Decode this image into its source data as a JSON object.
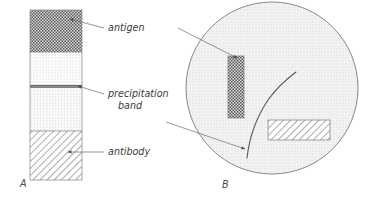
{
  "figure": {
    "type": "immunodiffusion-precipitation-diagram",
    "background_color": "#ffffff",
    "line_color": "#6b6b6b",
    "text_color": "#3b3b3b"
  },
  "panels": [
    {
      "id": "A",
      "label": "A",
      "label_x": 20,
      "label_y": 187,
      "description": "tube showing layered antigen, precipitation band and antibody"
    },
    {
      "id": "B",
      "label": "B",
      "label_x": 222,
      "label_y": 188,
      "description": "magnified circular inset of the precipitation zone"
    }
  ],
  "tube": {
    "x": 30,
    "y": 10,
    "width": 52,
    "height": 170,
    "border_color": "#808080",
    "segments": [
      {
        "name": "antigen",
        "pattern": "dark-checker",
        "y": 10,
        "height": 42,
        "fill": "#6e6e6e"
      },
      {
        "name": "upper-clear-zone",
        "pattern": "fine-stipple-light",
        "y": 52,
        "height": 33,
        "fill": "#f6f6f6"
      },
      {
        "name": "precipitation-band",
        "pattern": "solid-dark-line",
        "y": 85,
        "height": 3,
        "fill": "#8a8a8a"
      },
      {
        "name": "lower-clear-zone",
        "pattern": "fine-stipple-light",
        "y": 88,
        "height": 43,
        "fill": "#f2f2f2"
      },
      {
        "name": "antibody",
        "pattern": "diagonal-hatch",
        "y": 131,
        "height": 49,
        "fill": "#ffffff"
      }
    ]
  },
  "labels": [
    {
      "id": "antigen",
      "text": "antigen",
      "x": 108,
      "y": 31,
      "anchor": "start",
      "leader": {
        "x1": 104,
        "y1": 28,
        "x2": 70,
        "y2": 19,
        "arrow": true
      }
    },
    {
      "id": "precipitation-band",
      "text_line1": "precipitation",
      "text_line2": "band",
      "x": 108,
      "y": 97,
      "y2": 109,
      "anchor": "start",
      "leader": {
        "x1": 104,
        "y1": 93,
        "x2": 78,
        "y2": 86,
        "arrow": true
      }
    },
    {
      "id": "antibody",
      "text": "antibody",
      "x": 108,
      "y": 155,
      "anchor": "start",
      "leader": {
        "x1": 104,
        "y1": 152,
        "x2": 68,
        "y2": 152,
        "arrow": true
      }
    }
  ],
  "inset": {
    "circle": {
      "cx": 272,
      "cy": 88,
      "r": 86,
      "fill": "#f0f0f0",
      "stroke": "#6b6b6b"
    },
    "antigen_block": {
      "name": "antigen-molecules",
      "x": 228,
      "y": 56,
      "width": 16,
      "height": 62,
      "pattern": "dark-checker",
      "fill": "#6e6e6e"
    },
    "antibody_block": {
      "name": "antibody-molecules",
      "x": 268,
      "y": 120,
      "width": 62,
      "height": 20,
      "pattern": "diagonal-hatch",
      "fill": "#ffffff"
    },
    "precipitation_curve": {
      "name": "precipitation-band-curve",
      "path": "M 247 158 C 249 140, 256 118, 268 100 C 278 86, 288 78, 296 72"
    }
  },
  "connectors": [
    {
      "id": "antigen-connector",
      "from_panel": "A",
      "to_panel": "B",
      "x1": 178,
      "y1": 28,
      "x2": 237,
      "y2": 58,
      "arrow": true
    },
    {
      "id": "precipitation-connector",
      "from_panel": "A",
      "to_panel": "B",
      "x1": 166,
      "y1": 122,
      "x2": 245,
      "y2": 149,
      "arrow": true
    }
  ]
}
